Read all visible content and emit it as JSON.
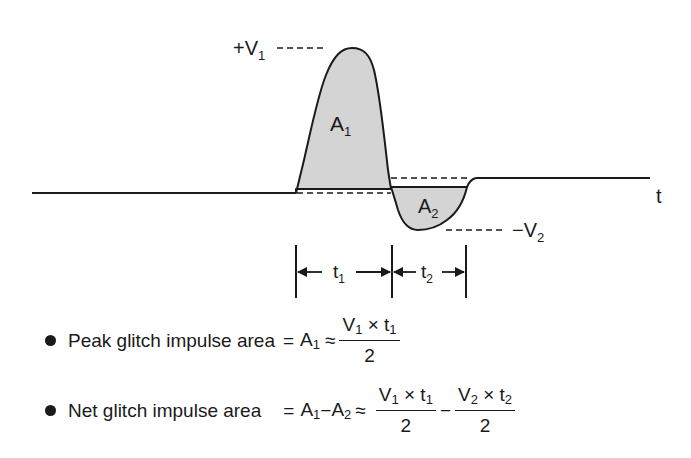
{
  "diagram": {
    "title": "Glitch impulse area",
    "labels": {
      "plus_v1": {
        "sign": "+",
        "var": "V",
        "sub": "1"
      },
      "minus_v2": {
        "sign": "−",
        "var": "V",
        "sub": "2"
      },
      "a1": {
        "var": "A",
        "sub": "1"
      },
      "a2": {
        "var": "A",
        "sub": "2"
      },
      "t_axis": "t",
      "t1": {
        "var": "t",
        "sub": "1"
      },
      "t2": {
        "var": "t",
        "sub": "2"
      }
    },
    "colors": {
      "line": "#1a1a1a",
      "fill": "#d4d4d4"
    }
  },
  "formulas": [
    {
      "label": "Peak glitch impulse area",
      "eq1": "=",
      "lhs_var": "A",
      "lhs_sub": "1",
      "approx": "≈",
      "frac1_num_a": "V",
      "frac1_num_a_sub": "1",
      "frac1_op": "×",
      "frac1_num_b": "t",
      "frac1_num_b_sub": "1",
      "frac1_den": "2"
    },
    {
      "label": "Net glitch impulse area",
      "eq1": "=",
      "lhs_var1": "A",
      "lhs_sub1": "1",
      "minus": "−",
      "lhs_var2": "A",
      "lhs_sub2": "2",
      "approx": "≈",
      "frac1_num_a": "V",
      "frac1_num_a_sub": "1",
      "frac1_op": "×",
      "frac1_num_b": "t",
      "frac1_num_b_sub": "1",
      "frac1_den": "2",
      "between": "−",
      "frac2_num_a": "V",
      "frac2_num_a_sub": "2",
      "frac2_op": "×",
      "frac2_num_b": "t",
      "frac2_num_b_sub": "2",
      "frac2_den": "2"
    }
  ]
}
